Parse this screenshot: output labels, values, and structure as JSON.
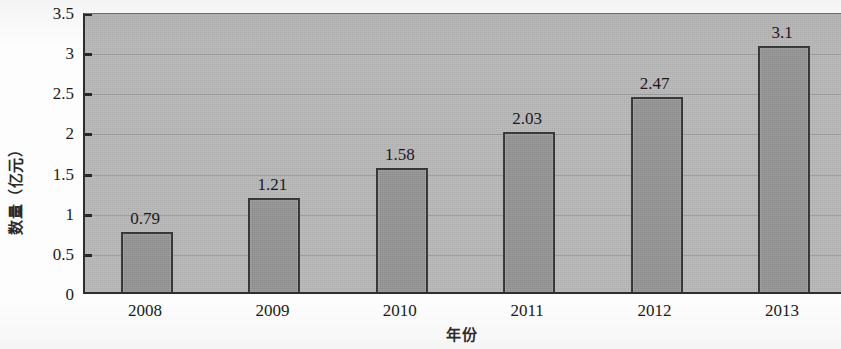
{
  "chart_data": {
    "type": "bar",
    "title": "",
    "subtitle": "",
    "categories": [
      "2008",
      "2009",
      "2010",
      "2011",
      "2012",
      "2013"
    ],
    "values": [
      0.79,
      1.21,
      1.58,
      2.03,
      2.47,
      3.1
    ],
    "value_labels": [
      "0.79",
      "1.21",
      "1.58",
      "2.03",
      "2.47",
      "3.1"
    ],
    "series": [
      {
        "name": "",
        "values": [
          0.79,
          1.21,
          1.58,
          2.03,
          2.47,
          3.1
        ]
      }
    ],
    "xlabel": "年份",
    "ylabel": "数量（亿元）",
    "ylim": [
      0,
      3.5
    ],
    "yticks": [
      0,
      0.5,
      1,
      1.5,
      2,
      2.5,
      3,
      3.5
    ],
    "ytick_labels": [
      "0",
      "0.5",
      "1",
      "1.5",
      "2",
      "2.5",
      "3",
      "3.5"
    ],
    "grid": true,
    "legend": false,
    "legend_position": "none",
    "colors": {
      "bar_fill": "#959595",
      "bar_border": "#343434",
      "plot_background": "#b9b9b9",
      "gridline": "#9d9d9d",
      "axis": "#2e2e2e",
      "text": "#1a1a1a"
    }
  },
  "axis": {
    "y_title": "数量（亿元）",
    "x_title": "年份"
  }
}
